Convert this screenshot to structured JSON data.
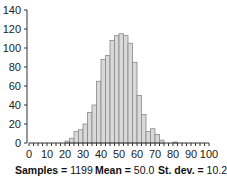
{
  "chart_data": {
    "type": "bar",
    "title": "",
    "xlabel": "",
    "ylabel": "",
    "xlim": [
      0,
      100
    ],
    "ylim": [
      0,
      140
    ],
    "bin_width": 2.5,
    "x_ticks": [
      0,
      10,
      20,
      30,
      40,
      50,
      60,
      70,
      80,
      90,
      100
    ],
    "y_ticks": [
      0,
      20,
      40,
      60,
      80,
      100,
      120,
      140
    ],
    "bin_starts": [
      0,
      2.5,
      5,
      7.5,
      10,
      12.5,
      15,
      17.5,
      20,
      22.5,
      25,
      27.5,
      30,
      32.5,
      35,
      37.5,
      40,
      42.5,
      45,
      47.5,
      50,
      52.5,
      55,
      57.5,
      60,
      62.5,
      65,
      67.5,
      70,
      72.5,
      75,
      77.5,
      80,
      82.5,
      85,
      87.5,
      90,
      92.5,
      95,
      97.5
    ],
    "values": [
      0,
      0,
      0,
      0,
      0,
      0,
      0,
      0,
      2,
      5,
      12,
      14,
      20,
      32,
      40,
      65,
      88,
      92,
      108,
      113,
      115,
      113,
      105,
      85,
      50,
      30,
      12,
      15,
      9,
      3,
      0,
      0,
      1,
      0,
      0,
      0,
      0,
      0,
      0,
      0
    ],
    "bar_fill": "#d9d9d9",
    "bar_stroke": "#888888",
    "grid": false,
    "legend": null
  },
  "stats": {
    "samples_label": "Samples",
    "samples_value": "1199",
    "mean_label": "Mean",
    "mean_value": "50.0",
    "stdev_label": "St. dev.",
    "stdev_value": "10.2"
  }
}
